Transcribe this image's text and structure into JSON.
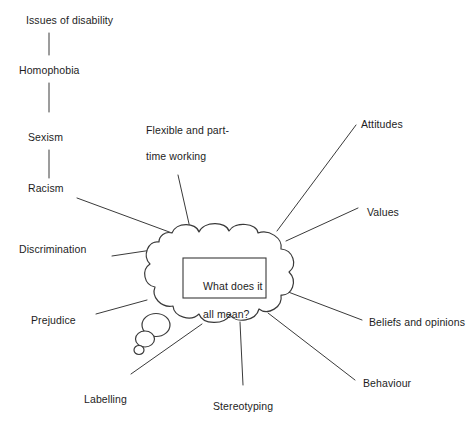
{
  "diagram": {
    "stroke_color": "#3a3a3a",
    "text_color": "#1d1d1d",
    "background_color": "#ffffff",
    "center_box": {
      "text": "What does it\nall mean?",
      "line1": "What does it",
      "line2": "all mean?"
    },
    "chain": {
      "items": [
        {
          "label": "Issues of disability"
        },
        {
          "label": "Homophobia"
        },
        {
          "label": "Sexism"
        },
        {
          "label": "Racism"
        }
      ]
    },
    "spokes": [
      {
        "label": "Flexible and part-\ntime working",
        "line1": "Flexible and part-",
        "line2": "time working",
        "position": "top-center-left"
      },
      {
        "label": "Attitudes",
        "position": "top-right"
      },
      {
        "label": "Values",
        "position": "right-upper"
      },
      {
        "label": "Beliefs and opinions",
        "position": "right-lower"
      },
      {
        "label": "Behaviour",
        "position": "bottom-right"
      },
      {
        "label": "Stereotyping",
        "position": "bottom-center"
      },
      {
        "label": "Labelling",
        "position": "bottom-left"
      },
      {
        "label": "Prejudice",
        "position": "left-lower"
      },
      {
        "label": "Discrimination",
        "position": "left-upper"
      },
      {
        "label": "Racism",
        "position": "left-upper-chain"
      }
    ]
  }
}
